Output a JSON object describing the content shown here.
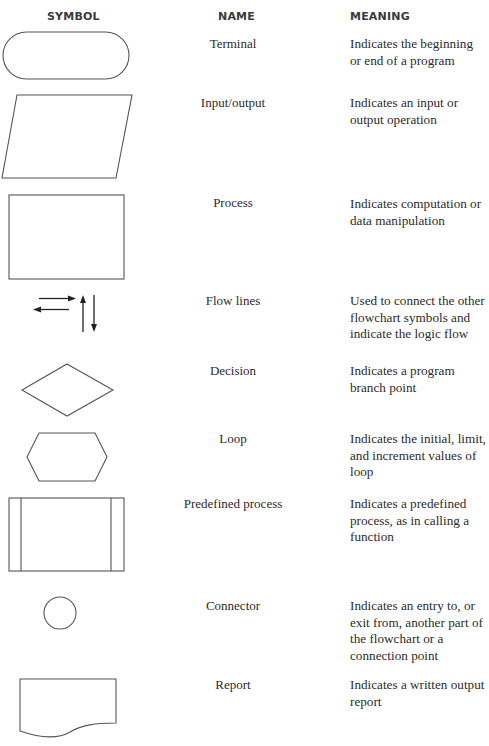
{
  "headers": {
    "symbol": "SYMBOL",
    "name": "NAME",
    "meaning": "MEANING"
  },
  "rows": [
    {
      "symbol": "terminal-icon",
      "name": "Terminal",
      "meaning": "Indicates the beginning or end of a program"
    },
    {
      "symbol": "input-output-icon",
      "name": "Input/output",
      "meaning": "Indicates an input or output operation"
    },
    {
      "symbol": "process-icon",
      "name": "Process",
      "meaning": "Indicates computation or data manipulation"
    },
    {
      "symbol": "flow-lines-icon",
      "name": "Flow lines",
      "meaning": "Used to connect the other flowchart symbols and indicate the logic flow"
    },
    {
      "symbol": "decision-icon",
      "name": "Decision",
      "meaning": "Indicates a program branch point"
    },
    {
      "symbol": "loop-icon",
      "name": "Loop",
      "meaning": "Indicates the initial, limit, and increment values of loop"
    },
    {
      "symbol": "predefined-process-icon",
      "name": "Predefined process",
      "meaning": "Indicates a predefined process, as in calling a function"
    },
    {
      "symbol": "connector-icon",
      "name": "Connector",
      "meaning": "Indicates an entry to, or exit from, another part of the flowchart or a connection point"
    },
    {
      "symbol": "report-icon",
      "name": "Report",
      "meaning": "Indicates a written output report"
    }
  ]
}
